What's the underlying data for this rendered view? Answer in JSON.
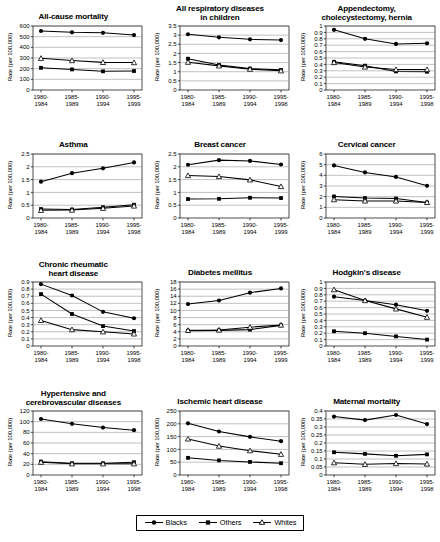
{
  "figure": {
    "title": "",
    "legend": {
      "position": "bottom-center",
      "entries": [
        {
          "label": "Blacks",
          "marker": "filled-circle"
        },
        {
          "label": "Others",
          "marker": "filled-square"
        },
        {
          "label": "Whites",
          "marker": "open-triangle"
        }
      ]
    },
    "common_ylabel": "Rate (per 100,000)"
  },
  "chart_data": [
    {
      "type": "line",
      "title": "All-cause mortality",
      "xlabel": "",
      "ylabel": "Rate (per 100,000)",
      "categories": [
        "1980-\n1984",
        "1985-\n1989",
        "1990-\n1994",
        "1995-\n1999"
      ],
      "ylim": [
        0,
        600
      ],
      "yticks": [
        0,
        100,
        200,
        300,
        400,
        500,
        600
      ],
      "grid": true,
      "series": [
        {
          "name": "Blacks",
          "marker": "filled-circle",
          "values": [
            553,
            541,
            536,
            515
          ]
        },
        {
          "name": "Others",
          "marker": "filled-square",
          "values": [
            208,
            193,
            175,
            178
          ]
        },
        {
          "name": "Whites",
          "marker": "open-triangle",
          "values": [
            297,
            276,
            259,
            257
          ]
        }
      ]
    },
    {
      "type": "line",
      "title": "All respiratory diseases\nin children",
      "xlabel": "",
      "ylabel": "Rate (per 100,000)",
      "categories": [
        "1980-\n1984",
        "1985-\n1989",
        "1990-\n1994",
        "1995-\n1998"
      ],
      "ylim": [
        0,
        3.5
      ],
      "yticks": [
        0,
        0.5,
        1,
        1.5,
        2,
        2.5,
        3,
        3.5
      ],
      "grid": true,
      "series": [
        {
          "name": "Blacks",
          "marker": "filled-circle",
          "values": [
            3.05,
            2.88,
            2.77,
            2.73
          ]
        },
        {
          "name": "Others",
          "marker": "filled-square",
          "values": [
            1.71,
            1.37,
            1.17,
            1.1
          ]
        },
        {
          "name": "Whites",
          "marker": "open-triangle",
          "values": [
            1.52,
            1.32,
            1.14,
            1.05
          ]
        }
      ]
    },
    {
      "type": "line",
      "title": "Appendectomy,\ncholecystectomy, hernia",
      "xlabel": "",
      "ylabel": "Rate (per 100,000)",
      "categories": [
        "1980-\n1984",
        "1985-\n1989",
        "1990-\n1994",
        "1995-\n1998"
      ],
      "ylim": [
        0,
        1
      ],
      "yticks": [
        0,
        0.1,
        0.2,
        0.3,
        0.4,
        0.5,
        0.6,
        0.7,
        0.8,
        0.9,
        1
      ],
      "grid": true,
      "series": [
        {
          "name": "Blacks",
          "marker": "filled-circle",
          "values": [
            0.94,
            0.8,
            0.72,
            0.73
          ]
        },
        {
          "name": "Others",
          "marker": "filled-square",
          "values": [
            0.44,
            0.38,
            0.29,
            0.285
          ]
        },
        {
          "name": "Whites",
          "marker": "open-triangle",
          "values": [
            0.43,
            0.36,
            0.32,
            0.32
          ]
        }
      ]
    },
    {
      "type": "line",
      "title": "Asthma",
      "xlabel": "",
      "ylabel": "Rate (per 100,000)",
      "categories": [
        "1980-\n1984",
        "1985-\n1989",
        "1990-\n1994",
        "1995-\n1998"
      ],
      "ylim": [
        0,
        2.5
      ],
      "yticks": [
        0,
        0.5,
        1,
        1.5,
        2,
        2.5
      ],
      "grid": true,
      "series": [
        {
          "name": "Blacks",
          "marker": "filled-circle",
          "values": [
            1.42,
            1.75,
            1.94,
            2.17
          ]
        },
        {
          "name": "Others",
          "marker": "filled-square",
          "values": [
            0.35,
            0.33,
            0.42,
            0.52
          ]
        },
        {
          "name": "Whites",
          "marker": "open-triangle",
          "values": [
            0.3,
            0.31,
            0.38,
            0.47
          ]
        }
      ]
    },
    {
      "type": "line",
      "title": "Breast cancer",
      "xlabel": "",
      "ylabel": "Rate (per 100,000)",
      "categories": [
        "1980-\n1984",
        "1985-\n1989",
        "1990-\n1994",
        "1995-\n1999"
      ],
      "ylim": [
        0,
        2.5
      ],
      "yticks": [
        0,
        0.5,
        1,
        1.5,
        2,
        2.5
      ],
      "grid": true,
      "series": [
        {
          "name": "Blacks",
          "marker": "filled-circle",
          "values": [
            2.08,
            2.26,
            2.23,
            2.09
          ]
        },
        {
          "name": "Others",
          "marker": "filled-square",
          "values": [
            0.74,
            0.75,
            0.79,
            0.78
          ]
        },
        {
          "name": "Whites",
          "marker": "open-triangle",
          "values": [
            1.66,
            1.62,
            1.49,
            1.23
          ]
        }
      ]
    },
    {
      "type": "line",
      "title": "Cervical cancer",
      "xlabel": "",
      "ylabel": "Rate (per 100,000)",
      "categories": [
        "1980-\n1984",
        "1985-\n1989",
        "1990-\n1994",
        "1995-\n1999"
      ],
      "ylim": [
        0,
        6
      ],
      "yticks": [
        0,
        1,
        2,
        3,
        4,
        5,
        6
      ],
      "grid": true,
      "series": [
        {
          "name": "Blacks",
          "marker": "filled-circle",
          "values": [
            4.93,
            4.27,
            3.85,
            3.02
          ]
        },
        {
          "name": "Others",
          "marker": "filled-square",
          "values": [
            2.02,
            1.87,
            1.82,
            1.45
          ]
        },
        {
          "name": "Whites",
          "marker": "open-triangle",
          "values": [
            1.72,
            1.6,
            1.6,
            1.46
          ]
        }
      ]
    },
    {
      "type": "line",
      "title": "Chronic rheumatic\nheart disease",
      "xlabel": "",
      "ylabel": "Rate (per 100,000)",
      "categories": [
        "1980-\n1984",
        "1985-\n1989",
        "1990-\n1994",
        "1995-\n1998"
      ],
      "ylim": [
        0,
        0.9
      ],
      "yticks": [
        0,
        0.1,
        0.2,
        0.3,
        0.4,
        0.5,
        0.6,
        0.7,
        0.8,
        0.9
      ],
      "grid": true,
      "series": [
        {
          "name": "Blacks",
          "marker": "filled-circle",
          "values": [
            0.87,
            0.71,
            0.48,
            0.39
          ]
        },
        {
          "name": "Others",
          "marker": "filled-square",
          "values": [
            0.73,
            0.45,
            0.28,
            0.21
          ]
        },
        {
          "name": "Whites",
          "marker": "open-triangle",
          "values": [
            0.36,
            0.23,
            0.2,
            0.17
          ]
        }
      ]
    },
    {
      "type": "line",
      "title": "Diabetes mellitus",
      "xlabel": "",
      "ylabel": "Rate (per 100,000)",
      "categories": [
        "1980-\n1984",
        "1985-\n1989",
        "1990-\n1994",
        "1995-\n1999"
      ],
      "ylim": [
        0,
        18
      ],
      "yticks": [
        0,
        2,
        4,
        6,
        8,
        10,
        12,
        14,
        16,
        18
      ],
      "grid": true,
      "series": [
        {
          "name": "Blacks",
          "marker": "filled-circle",
          "values": [
            11.8,
            12.8,
            15.0,
            16.2
          ]
        },
        {
          "name": "Others",
          "marker": "filled-square",
          "values": [
            4.3,
            4.4,
            4.6,
            5.8
          ]
        },
        {
          "name": "Whites",
          "marker": "open-triangle",
          "values": [
            4.4,
            4.5,
            5.3,
            5.9
          ]
        }
      ]
    },
    {
      "type": "line",
      "title": "Hodgkin's disease",
      "xlabel": "",
      "ylabel": "Rate (per 100,000)",
      "categories": [
        "1980-\n1984",
        "1985-\n1989",
        "1990-\n1994",
        "1995-\n1999"
      ],
      "ylim": [
        0,
        1
      ],
      "yticks": [
        0,
        0.1,
        0.2,
        0.3,
        0.4,
        0.5,
        0.6,
        0.7,
        0.8,
        0.9,
        1
      ],
      "grid": true,
      "series": [
        {
          "name": "Blacks",
          "marker": "filled-circle",
          "values": [
            0.77,
            0.71,
            0.645,
            0.55
          ]
        },
        {
          "name": "Others",
          "marker": "filled-square",
          "values": [
            0.23,
            0.2,
            0.15,
            0.1
          ]
        },
        {
          "name": "Whites",
          "marker": "open-triangle",
          "values": [
            0.88,
            0.71,
            0.58,
            0.45
          ]
        }
      ]
    },
    {
      "type": "line",
      "title": "Hypertensive and\ncerebrovascular diseases",
      "xlabel": "",
      "ylabel": "Rate (per 100,000)",
      "categories": [
        "1980-\n1984",
        "1985-\n1989",
        "1990-\n1994",
        "1995-\n1998"
      ],
      "ylim": [
        0,
        120
      ],
      "yticks": [
        0,
        20,
        40,
        60,
        80,
        100,
        120
      ],
      "grid": true,
      "series": [
        {
          "name": "Blacks",
          "marker": "filled-circle",
          "values": [
            105,
            96,
            89,
            84
          ]
        },
        {
          "name": "Others",
          "marker": "filled-square",
          "values": [
            25,
            22,
            22,
            24
          ]
        },
        {
          "name": "Whites",
          "marker": "open-triangle",
          "values": [
            24,
            21,
            21,
            21
          ]
        }
      ]
    },
    {
      "type": "line",
      "title": "Ischemic heart disease",
      "xlabel": "",
      "ylabel": "Rate (per 100,000)",
      "categories": [
        "1980-\n1984",
        "1985-\n1989",
        "1990-\n1994",
        "1995-\n1998"
      ],
      "ylim": [
        0,
        250
      ],
      "yticks": [
        0,
        50,
        100,
        150,
        200,
        250
      ],
      "grid": true,
      "series": [
        {
          "name": "Blacks",
          "marker": "filled-circle",
          "values": [
            202,
            170,
            149,
            132
          ]
        },
        {
          "name": "Others",
          "marker": "filled-square",
          "values": [
            67,
            57,
            51,
            46
          ]
        },
        {
          "name": "Whites",
          "marker": "open-triangle",
          "values": [
            141,
            113,
            95,
            81
          ]
        }
      ]
    },
    {
      "type": "line",
      "title": "Maternal mortality",
      "xlabel": "",
      "ylabel": "Rate (per 100,000)",
      "categories": [
        "1980-\n1984",
        "1985-\n1989",
        "1990-\n1994",
        "1995-\n1998"
      ],
      "ylim": [
        0,
        0.4
      ],
      "yticks": [
        0,
        0.05,
        0.1,
        0.15,
        0.2,
        0.25,
        0.3,
        0.35,
        0.4
      ],
      "grid": true,
      "series": [
        {
          "name": "Blacks",
          "marker": "filled-circle",
          "values": [
            0.365,
            0.343,
            0.375,
            0.318
          ]
        },
        {
          "name": "Others",
          "marker": "filled-square",
          "values": [
            0.142,
            0.132,
            0.12,
            0.129
          ]
        },
        {
          "name": "Whites",
          "marker": "open-triangle",
          "values": [
            0.077,
            0.067,
            0.072,
            0.069
          ]
        }
      ]
    }
  ]
}
